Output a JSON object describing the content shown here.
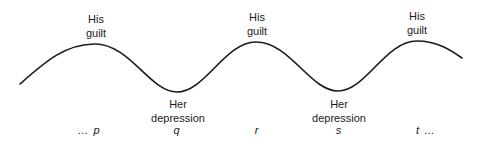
{
  "diagram": {
    "type": "oscillation-wave",
    "curve_color": "#1a1a1a",
    "peaks": [
      {
        "line1": "His",
        "line2": "guilt"
      },
      {
        "line1": "His",
        "line2": "guilt"
      },
      {
        "line1": "His",
        "line2": "guilt"
      }
    ],
    "troughs": [
      {
        "line1": "Her",
        "line2": "depression"
      },
      {
        "line1": "Her",
        "line2": "depression"
      }
    ],
    "axis_points": [
      "… p",
      "q",
      "r",
      "s",
      "t …"
    ]
  }
}
